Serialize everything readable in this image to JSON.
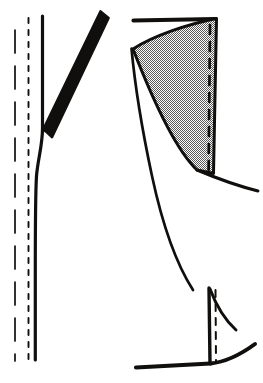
{
  "document": {
    "title": "Garment pattern construction diagram",
    "kind": "technical-line-drawing",
    "background_color": "#ffffff",
    "ink_color": "#100f0d",
    "shading_color": "#8d8d8d",
    "canvas": {
      "width": 263,
      "height": 383
    },
    "visible_text": []
  },
  "figures": [
    {
      "id": "left-figure",
      "label": "left-seam-view",
      "elements": [
        {
          "name": "long-dash-guide-line",
          "kind": "dashed-vertical-line",
          "x": 15,
          "y_start": 30,
          "y_end": 361,
          "dash_pattern": "22 12",
          "stroke_width": 1.6
        },
        {
          "name": "fine-dotted-guide-line",
          "kind": "dotted-vertical-line",
          "x": 28,
          "y_start": 18,
          "y_end": 360,
          "dash_pattern": "5 7",
          "stroke_width": 1.8
        },
        {
          "name": "center-front-edge",
          "kind": "curved-edge",
          "stroke_width": 3.2
        },
        {
          "name": "diagonal-strap",
          "kind": "closed-band-shape",
          "stroke_width": 2.6
        }
      ]
    },
    {
      "id": "right-figure",
      "label": "gusset-panel-view",
      "elements": [
        {
          "name": "top-horizontal-edge",
          "kind": "straight-line",
          "stroke_width": 4.0
        },
        {
          "name": "shaded-gusset-panel",
          "kind": "filled-region",
          "fill": "stipple-screen",
          "fill_color": "#8d8d8d",
          "stroke_width": 3.0
        },
        {
          "name": "gusset-dashed-seam-line",
          "kind": "dashed-vertical-line",
          "dash_pattern": "9 8",
          "stroke_width": 2.6
        },
        {
          "name": "long-side-curve",
          "kind": "curved-edge",
          "stroke_width": 2.6
        },
        {
          "name": "lower-vertical-edge",
          "kind": "straight-line",
          "stroke_width": 3.4
        },
        {
          "name": "lower-dashed-seam-line",
          "kind": "dashed-vertical-line",
          "dash_pattern": "7 7",
          "stroke_width": 2.0
        },
        {
          "name": "bottom-hem-line",
          "kind": "angled-line",
          "stroke_width": 4.0
        },
        {
          "name": "lower-flare-curve",
          "kind": "curved-edge",
          "stroke_width": 3.0
        }
      ]
    }
  ]
}
